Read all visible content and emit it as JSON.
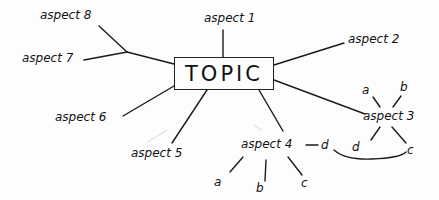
{
  "topic": "TOPIC",
  "aspects": {
    "a1": "aspect 1",
    "a2": "aspect 2",
    "a3": "aspect 3",
    "a4": "aspect 4",
    "a5": "aspect 5",
    "a6": "aspect 6",
    "a7": "aspect 7",
    "a8": "aspect 8"
  },
  "aspect3_children": [
    "a",
    "b",
    "c",
    "d"
  ],
  "aspect4_children": [
    "a",
    "b",
    "c",
    "d"
  ],
  "colors": {
    "ink": "#111111",
    "paper": "#fdfdfd"
  }
}
